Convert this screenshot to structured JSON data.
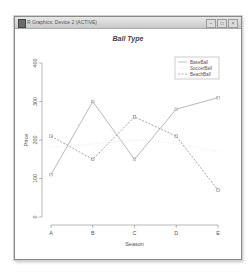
{
  "window": {
    "title": "R Graphics: Device 2 (ACTIVE)",
    "controls": [
      {
        "name": "minimize",
        "glyph": "–"
      },
      {
        "name": "maximize",
        "glyph": "□"
      },
      {
        "name": "close",
        "glyph": "×"
      }
    ]
  },
  "chart_data": {
    "type": "line",
    "title": "Ball Type",
    "xlabel": "Season",
    "ylabel": "Price",
    "categories": [
      "A",
      "B",
      "C",
      "D",
      "E"
    ],
    "yticks": [
      0,
      100,
      200,
      300,
      400
    ],
    "ylim": [
      0,
      400
    ],
    "grid": false,
    "legend_position": "topright",
    "series": [
      {
        "name": "BaseBall",
        "values": [
          110,
          300,
          150,
          280,
          310
        ],
        "color": "#a6a6a6",
        "line": "solid",
        "marker": "square"
      },
      {
        "name": "SoccerBall",
        "values": [
          180,
          190,
          200,
          190,
          170
        ],
        "color": "#ececec",
        "line": "dotted",
        "marker": "none"
      },
      {
        "name": "BeachBall",
        "values": [
          210,
          150,
          260,
          210,
          70
        ],
        "color": "#8c8c8c",
        "line": "dashed",
        "marker": "square"
      }
    ]
  }
}
